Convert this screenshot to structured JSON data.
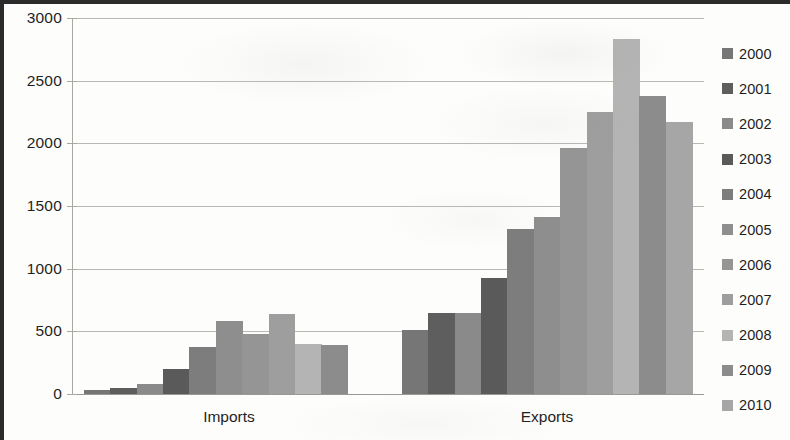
{
  "chart_data": {
    "type": "bar",
    "title": "",
    "subtitle": "",
    "xlabel": "",
    "ylabel": "",
    "categories": [
      "Imports",
      "Exports"
    ],
    "ylim": [
      0,
      3000
    ],
    "yticks": [
      0,
      500,
      1000,
      1500,
      2000,
      2500,
      3000
    ],
    "ytick_labels": [
      "0",
      "500",
      "1000",
      "1500",
      "2000",
      "2500",
      "3000"
    ],
    "grid": true,
    "legend_position": "right",
    "legend_entries": [
      "2000",
      "2001",
      "2002",
      "2003",
      "2004",
      "2005",
      "2006",
      "2007",
      "2008",
      "2009",
      "2010"
    ],
    "series": [
      {
        "name": "2000",
        "color": "#767676",
        "values": [
          35,
          510
        ]
      },
      {
        "name": "2001",
        "color": "#5e5e5e",
        "values": [
          48,
          645
        ]
      },
      {
        "name": "2002",
        "color": "#8a8a8a",
        "values": [
          82,
          645
        ]
      },
      {
        "name": "2003",
        "color": "#5a5a5a",
        "values": [
          200,
          925
        ]
      },
      {
        "name": "2004",
        "color": "#7d7d7d",
        "values": [
          375,
          1320
        ]
      },
      {
        "name": "2005",
        "color": "#8e8e8e",
        "values": [
          580,
          1410
        ]
      },
      {
        "name": "2006",
        "color": "#959595",
        "values": [
          478,
          1965
        ]
      },
      {
        "name": "2007",
        "color": "#9e9e9e",
        "values": [
          640,
          2250
        ]
      },
      {
        "name": "2008",
        "color": "#b4b4b4",
        "values": [
          400,
          2830
        ]
      },
      {
        "name": "2009",
        "color": "#8c8c8c",
        "values": [
          395,
          2380
        ]
      },
      {
        "name": "2010",
        "color": "#a6a6a6",
        "values": [
          0,
          2170
        ]
      }
    ]
  },
  "axis": {
    "y_tick_0": "0",
    "y_tick_1": "500",
    "y_tick_2": "1000",
    "y_tick_3": "1500",
    "y_tick_4": "2000",
    "y_tick_5": "2500",
    "y_tick_6": "3000"
  },
  "category_labels": {
    "imports": "Imports",
    "exports": "Exports"
  },
  "legend": {
    "items": [
      {
        "label": "2000"
      },
      {
        "label": "2001"
      },
      {
        "label": "2002"
      },
      {
        "label": "2003"
      },
      {
        "label": "2004"
      },
      {
        "label": "2005"
      },
      {
        "label": "2006"
      },
      {
        "label": "2007"
      },
      {
        "label": "2008"
      },
      {
        "label": "2009"
      },
      {
        "label": "2010"
      }
    ]
  }
}
